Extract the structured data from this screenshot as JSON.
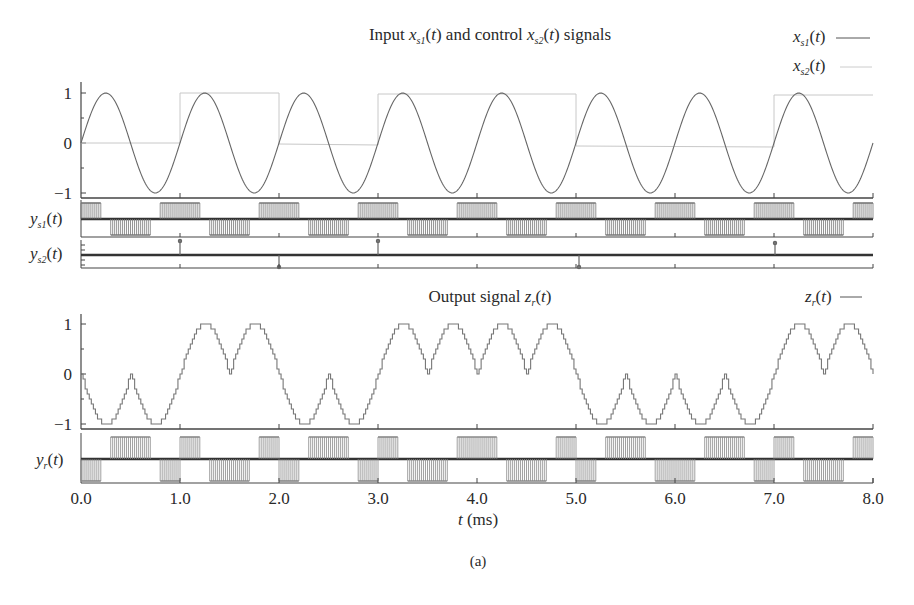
{
  "figure": {
    "caption": "(a)",
    "xlabel_var": "t",
    "xlabel_unit": " (ms)"
  },
  "top_panel": {
    "title_pre": "Input ",
    "title_mid": " and control ",
    "title_post": " signals",
    "legend": [
      {
        "label": "x_s1(t)",
        "color": "#555555"
      },
      {
        "label": "x_s2(t)",
        "color": "#bbbbbb"
      }
    ]
  },
  "bottom_panel": {
    "title_pre": "Output signal ",
    "legend": [
      {
        "label": "z_r(t)",
        "color": "#555555"
      }
    ]
  },
  "strips": {
    "ys1_label": "y_s1(t)",
    "ys2_label": "y_s2(t)",
    "yr_label": "y_r(t)"
  },
  "chart_data": [
    {
      "type": "line",
      "title": "Input x_s1(t) and control x_s2(t) signals",
      "xlabel": "t (ms)",
      "ylabel": "",
      "xlim": [
        0,
        8
      ],
      "ylim": [
        -1,
        1
      ],
      "yticks": [
        -1,
        0,
        1
      ],
      "xticks": [
        "0.0",
        "1.0",
        "2.0",
        "3.0",
        "4.0",
        "5.0",
        "6.0",
        "7.0",
        "8.0"
      ],
      "series": [
        {
          "name": "x_s1(t)",
          "description": "sinusoid, amplitude 1, period 1 ms (1 kHz), starting at 0 rising",
          "x": [
            0,
            0.25,
            0.5,
            0.75,
            1,
            1.25,
            1.5,
            1.75,
            2,
            2.25,
            2.5,
            2.75,
            3,
            3.25,
            3.5,
            3.75,
            4,
            4.25,
            4.5,
            4.75,
            5,
            5.25,
            5.5,
            5.75,
            6,
            6.25,
            6.5,
            6.75,
            7,
            7.25,
            7.5,
            7.75,
            8
          ],
          "y": [
            0,
            1,
            0,
            -1,
            0,
            1,
            0,
            -1,
            0,
            1,
            0,
            -1,
            0,
            1,
            0,
            -1,
            0,
            1,
            0,
            -1,
            0,
            1,
            0,
            -1,
            0,
            1,
            0,
            -1,
            0,
            1,
            0,
            -1,
            0
          ]
        },
        {
          "name": "x_s2(t)",
          "description": "binary control square wave",
          "x": [
            0,
            1,
            1,
            2,
            2,
            3,
            3,
            5,
            5,
            7,
            7,
            8
          ],
          "y": [
            0,
            0,
            1,
            1,
            0,
            0,
            1,
            1,
            0,
            0,
            1,
            1
          ]
        }
      ],
      "legend_position": "top-right"
    },
    {
      "type": "line",
      "title": "Output signal z_r(t)",
      "xlabel": "t (ms)",
      "xlim": [
        0,
        8
      ],
      "ylim": [
        -1,
        1
      ],
      "yticks": [
        -1,
        0,
        1
      ],
      "series": [
        {
          "name": "z_r(t)",
          "description": "staircase-quantized reconstruction; |sin| folding where x_s2 = 1",
          "x": [
            0,
            0.25,
            0.5,
            0.75,
            1,
            1.25,
            1.5,
            1.75,
            2,
            2.25,
            2.5,
            2.75,
            3,
            3.25,
            3.5,
            3.75,
            4,
            4.25,
            4.5,
            4.75,
            5,
            5.25,
            5.5,
            5.75,
            6,
            6.25,
            6.5,
            6.75,
            7,
            7.25,
            7.5,
            7.75,
            8
          ],
          "y": [
            0,
            -1,
            0,
            1,
            0,
            1,
            0,
            -1,
            0,
            -1,
            0,
            1,
            0,
            1,
            0,
            1,
            0,
            -1,
            0,
            -1,
            0,
            -1,
            0,
            1,
            0,
            -1,
            0,
            1,
            0,
            1,
            0,
            -1,
            0
          ]
        }
      ],
      "legend_position": "top-right"
    },
    {
      "type": "bar",
      "title": "Spike/pulse trains y_s1(t), y_s2(t), y_r(t)",
      "series": [
        {
          "name": "y_s1(t)",
          "description": "dense positive pulse bursts during rising half of x_s1, negative bursts during falling half; bursts centred every 0.5 ms"
        },
        {
          "name": "y_s2(t)",
          "description": "single pulses at transitions of x_s2",
          "x": [
            1,
            2,
            3,
            5,
            7
          ],
          "y": [
            1,
            -1,
            1,
            -1,
            1
          ]
        },
        {
          "name": "y_r(t)",
          "description": "positive/negative pulse bursts driving the staircase output z_r(t)"
        }
      ]
    }
  ]
}
